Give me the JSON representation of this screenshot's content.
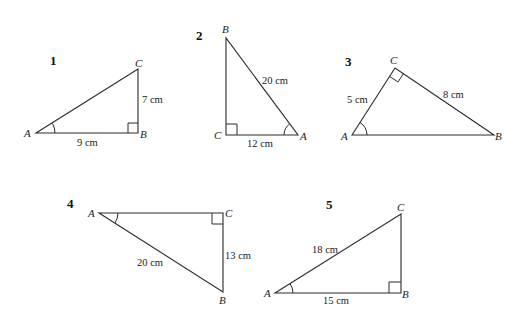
{
  "problems": [
    {
      "number": "1",
      "vertices": {
        "A": "A",
        "B": "B",
        "C": "C"
      },
      "sides": {
        "AB": "9 cm",
        "BC": "7 cm"
      },
      "right_angle_at": "B",
      "marked_angle": "A"
    },
    {
      "number": "2",
      "vertices": {
        "A": "A",
        "B": "B",
        "C": "C"
      },
      "sides": {
        "AB": "20 cm",
        "CA": "12 cm"
      },
      "right_angle_at": "C",
      "marked_angle": "A"
    },
    {
      "number": "3",
      "vertices": {
        "A": "A",
        "B": "B",
        "C": "C"
      },
      "sides": {
        "AC": "5 cm",
        "CB": "8 cm"
      },
      "right_angle_at": "C",
      "marked_angle": "A"
    },
    {
      "number": "4",
      "vertices": {
        "A": "A",
        "B": "B",
        "C": "C"
      },
      "sides": {
        "AB": "20 cm",
        "CB": "13 cm"
      },
      "right_angle_at": "C",
      "marked_angle": "A"
    },
    {
      "number": "5",
      "vertices": {
        "A": "A",
        "B": "B",
        "C": "C"
      },
      "sides": {
        "AC": "18 cm",
        "AB": "15 cm"
      },
      "right_angle_at": "B",
      "marked_angle": "A"
    }
  ]
}
